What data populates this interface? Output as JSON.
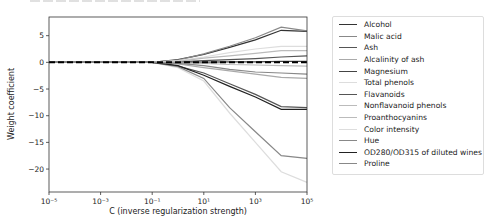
{
  "chart_data": {
    "type": "line",
    "title": "",
    "xlabel": "C (inverse regularization strength)",
    "ylabel": "Weight coefficient",
    "xscale": "log",
    "xlim": [
      -5,
      5
    ],
    "ylim": [
      -24.3,
      8.5
    ],
    "x_ticks": [
      {
        "exp": -5,
        "label": "10⁻⁵"
      },
      {
        "exp": -3,
        "label": "10⁻³"
      },
      {
        "exp": -1,
        "label": "10⁻¹"
      },
      {
        "exp": 1,
        "label": "10¹"
      },
      {
        "exp": 3,
        "label": "10³"
      },
      {
        "exp": 5,
        "label": "10⁵"
      }
    ],
    "y_ticks": [
      5,
      0,
      -5,
      -10,
      -15,
      -20
    ],
    "y_tick_labels": [
      "5",
      "0",
      "−5",
      "−10",
      "−15",
      "−20"
    ],
    "legend_position": "outside upper right",
    "x": [
      -5,
      -4,
      -3,
      -2,
      -1,
      0,
      1,
      2,
      3,
      4,
      5
    ],
    "series": [
      {
        "name": "Alcohol",
        "color": "#333333",
        "values": [
          0,
          0,
          0,
          0,
          0,
          0.5,
          1.5,
          2.8,
          4.2,
          6.0,
          5.8
        ]
      },
      {
        "name": "Malic acid",
        "color": "#888888",
        "values": [
          0,
          0,
          0,
          0,
          0,
          0.4,
          1.6,
          3.0,
          4.6,
          6.6,
          5.9
        ]
      },
      {
        "name": "Ash",
        "color": "#555555",
        "values": [
          0,
          0,
          0,
          0,
          0,
          0.1,
          0.3,
          0.5,
          0.7,
          1.0,
          1.2
        ]
      },
      {
        "name": "Alcalinity of ash",
        "color": "#aaaaaa",
        "values": [
          0,
          0,
          0,
          0,
          0,
          -0.3,
          -1.0,
          -1.6,
          -2.2,
          -2.8,
          -3.0
        ]
      },
      {
        "name": "Magnesium",
        "color": "#444444",
        "values": [
          0,
          0,
          0,
          0,
          0,
          0,
          0.05,
          0.1,
          0.1,
          0.2,
          0.2
        ]
      },
      {
        "name": "Total phenols",
        "color": "#dddddd",
        "values": [
          0,
          0,
          0,
          0,
          0,
          0.3,
          1.0,
          1.8,
          2.5,
          3.0,
          3.0
        ]
      },
      {
        "name": "Flavanoids",
        "color": "#555555",
        "values": [
          0,
          0,
          0,
          0,
          0,
          -0.7,
          -2.0,
          -4.0,
          -6.0,
          -8.3,
          -8.5
        ]
      },
      {
        "name": "Nonflavanoid phenols",
        "color": "#bbbbbb",
        "values": [
          0,
          0,
          0,
          0,
          0,
          -0.1,
          -0.2,
          -0.4,
          -0.5,
          -0.6,
          -0.7
        ]
      },
      {
        "name": "Proanthocyanins",
        "color": "#bbbbbb",
        "values": [
          0,
          0,
          0,
          0,
          0,
          0.2,
          0.8,
          1.2,
          1.7,
          2.2,
          2.2
        ]
      },
      {
        "name": "Color intensity",
        "color": "#dddddd",
        "values": [
          0,
          0,
          0,
          0,
          0,
          -1.0,
          -3.5,
          -9.5,
          -15.0,
          -20.5,
          -22.5
        ]
      },
      {
        "name": "Hue",
        "color": "#888888",
        "values": [
          0,
          0,
          0,
          0,
          0,
          -0.8,
          -3.0,
          -8.5,
          -13.0,
          -17.5,
          -18.0
        ]
      },
      {
        "name": "OD280/OD315 of diluted wines",
        "color": "#222222",
        "values": [
          0,
          0,
          0,
          0,
          0,
          -0.6,
          -2.4,
          -4.5,
          -6.5,
          -8.8,
          -8.8
        ]
      },
      {
        "name": "Proline",
        "color": "#888888",
        "values": [
          0,
          0,
          0,
          0,
          0,
          -0.2,
          -0.6,
          -1.3,
          -1.8,
          -2.0,
          -2.2
        ]
      }
    ],
    "baseline": {
      "style": "dashed",
      "color": "#000000",
      "y": 0
    }
  }
}
